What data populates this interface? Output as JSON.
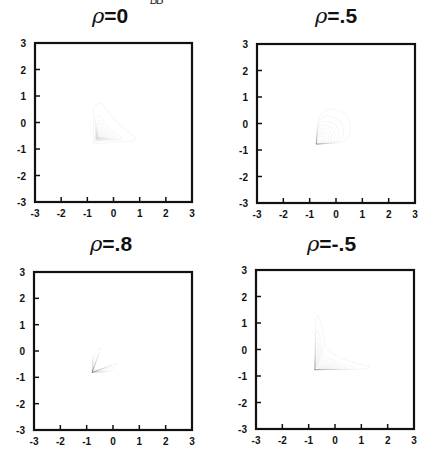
{
  "header_fragment": "BB",
  "panels": [
    {
      "title_symbol": "ρ",
      "title_value": "=0"
    },
    {
      "title_symbol": "ρ",
      "title_value": "=.5"
    },
    {
      "title_symbol": "ρ",
      "title_value": "=.8"
    },
    {
      "title_symbol": "ρ",
      "title_value": "=-.5"
    }
  ],
  "axis": {
    "x_ticks": [
      "-3",
      "-2",
      "-1",
      "0",
      "1",
      "2",
      "3"
    ],
    "y_ticks": [
      "3",
      "2",
      "1",
      "0",
      "-1",
      "-2",
      "-3"
    ]
  },
  "chart_data": [
    {
      "type": "contour",
      "title": "ρ=0",
      "xlabel": "",
      "ylabel": "",
      "xlim": [
        -3,
        3
      ],
      "ylim": [
        -3,
        3
      ],
      "x_ticks": [
        -3,
        -2,
        -1,
        0,
        1,
        2,
        3
      ],
      "y_ticks": [
        -3,
        -2,
        -1,
        0,
        1,
        2,
        3
      ],
      "grid": false,
      "description": "Nested skewed triangular density contours; mode near (-0.55,-0.55); outer contour apex ~(-0.55,0.8), right tip ~(0.85,-0.55), lower-left ~(-0.75,-0.75)",
      "num_contours": 9,
      "outer_contour_extent": {
        "x": [
          -0.8,
          0.85
        ],
        "y": [
          -0.8,
          0.8
        ]
      }
    },
    {
      "type": "contour",
      "title": "ρ=.5",
      "xlabel": "",
      "ylabel": "",
      "xlim": [
        -3,
        3
      ],
      "ylim": [
        -3,
        3
      ],
      "x_ticks": [
        -3,
        -2,
        -1,
        0,
        1,
        2,
        3
      ],
      "y_ticks": [
        -3,
        -2,
        -1,
        0,
        1,
        2,
        3
      ],
      "grid": false,
      "description": "Nested rounded-triangular contours converging to lower-left vertex ~(-0.75,-0.8); outer contour top ~(-0.2,0.55), right ~(0.55,-0.3)",
      "num_contours": 9,
      "outer_contour_extent": {
        "x": [
          -0.85,
          0.55
        ],
        "y": [
          -0.85,
          0.55
        ]
      }
    },
    {
      "type": "contour",
      "title": "ρ=.8",
      "xlabel": "",
      "ylabel": "",
      "xlim": [
        -3,
        3
      ],
      "ylim": [
        -3,
        3
      ],
      "x_ticks": [
        -3,
        -2,
        -1,
        0,
        1,
        2,
        3
      ],
      "y_ticks": [
        -3,
        -2,
        -1,
        0,
        1,
        2,
        3
      ],
      "grid": false,
      "description": "Cone-shaped nested contours with vertex ~(-0.8,-0.8) opening to upper right; outer contour rounded cap centered ~(0,0) radius ~0.45",
      "num_contours": 9,
      "outer_contour_extent": {
        "x": [
          -0.85,
          0.5
        ],
        "y": [
          -0.85,
          0.5
        ]
      }
    },
    {
      "type": "contour",
      "title": "ρ=-.5",
      "xlabel": "",
      "ylabel": "",
      "xlim": [
        -3,
        3
      ],
      "ylim": [
        -3,
        3
      ],
      "x_ticks": [
        -3,
        -2,
        -1,
        0,
        1,
        2,
        3
      ],
      "y_ticks": [
        -3,
        -2,
        -1,
        0,
        1,
        2,
        3
      ],
      "grid": false,
      "description": "Nested L/crescent-shaped contours with corner near (-0.7,-0.7); outer contour extends up to ~(-0.65,1.3) and right to ~(1.3,-0.65)",
      "num_contours": 10,
      "outer_contour_extent": {
        "x": [
          -0.8,
          1.3
        ],
        "y": [
          -0.8,
          1.3
        ]
      }
    }
  ]
}
